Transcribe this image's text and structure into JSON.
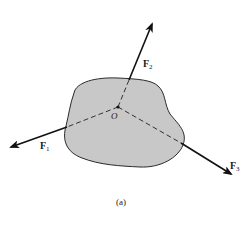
{
  "figure": {
    "caption": "(a)",
    "origin_label": "O",
    "body": {
      "fill": "#c8c8c8",
      "stroke": "#2a2a2a"
    },
    "forces": [
      {
        "id": "F1",
        "symbol": "F",
        "subscript": "1"
      },
      {
        "id": "F2",
        "symbol": "F",
        "subscript": "2"
      },
      {
        "id": "F3",
        "symbol": "F",
        "subscript": "3"
      }
    ],
    "colors": {
      "arrow": "#111111",
      "dashed_line": "#333333",
      "background": "#ffffff"
    }
  }
}
